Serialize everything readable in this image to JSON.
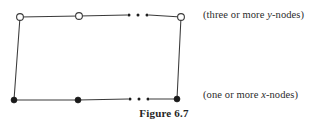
{
  "figure": {
    "caption": "Figure 6.7",
    "background_color": "#ffffff",
    "ink_color": "#3a3a3a",
    "node_fill_open": "#ffffff",
    "node_fill_solid": "#1a1a1a"
  },
  "labels": {
    "top": {
      "prefix": "(three or more ",
      "variable": "y",
      "suffix": "-nodes)",
      "full_text": "(three or more y-nodes)"
    },
    "bottom": {
      "prefix": "(one or more ",
      "variable": "x",
      "suffix": "-nodes)",
      "full_text": "(one or more x-nodes)"
    }
  },
  "chart_data": {
    "type": "diagram",
    "title": "Figure 6.7",
    "quadrilateral": {
      "top_left": [
        20,
        17
      ],
      "top_right": [
        181,
        17
      ],
      "bottom_right": [
        177,
        99
      ],
      "bottom_left": [
        14,
        100
      ]
    },
    "node_rows": [
      {
        "name": "y-nodes",
        "style": "open-circle",
        "radius": 3.4,
        "label": "(three or more y-nodes)",
        "nodes": [
          {
            "id": "y1",
            "x": 20,
            "y": 17
          },
          {
            "id": "y2",
            "x": 79,
            "y": 16
          },
          {
            "id": "y3",
            "x": 181,
            "y": 17
          }
        ],
        "ellipsis": {
          "x_start": 129,
          "x_end": 147,
          "y": 15,
          "count": 3
        }
      },
      {
        "name": "x-nodes",
        "style": "filled-circle",
        "radius": 3.0,
        "label": "(one or more x-nodes)",
        "nodes": [
          {
            "id": "x1",
            "x": 14,
            "y": 100
          },
          {
            "id": "x2",
            "x": 78,
            "y": 100
          },
          {
            "id": "x3",
            "x": 177,
            "y": 99
          }
        ],
        "ellipsis": {
          "x_start": 130,
          "x_end": 148,
          "y": 99,
          "count": 3
        }
      }
    ],
    "edges": [
      {
        "from": [
          20,
          17
        ],
        "to": [
          79,
          16
        ],
        "kind": "top"
      },
      {
        "from": [
          79,
          16
        ],
        "to": [
          127,
          15
        ],
        "kind": "top"
      },
      {
        "from": [
          149,
          15
        ],
        "to": [
          181,
          17
        ],
        "kind": "top"
      },
      {
        "from": [
          20,
          17
        ],
        "to": [
          14,
          100
        ],
        "kind": "left-side"
      },
      {
        "from": [
          181,
          17
        ],
        "to": [
          177,
          99
        ],
        "kind": "right-side"
      },
      {
        "from": [
          14,
          100
        ],
        "to": [
          78,
          100
        ],
        "kind": "bottom"
      },
      {
        "from": [
          78,
          100
        ],
        "to": [
          128,
          99
        ],
        "kind": "bottom"
      },
      {
        "from": [
          150,
          99
        ],
        "to": [
          177,
          99
        ],
        "kind": "bottom"
      }
    ]
  }
}
